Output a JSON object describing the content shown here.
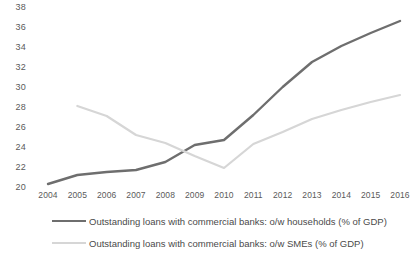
{
  "chart_data": {
    "type": "line",
    "title": "",
    "subtitle": "",
    "xlabel": "",
    "ylabel": "",
    "grid": false,
    "legend_position": "bottom",
    "x": [
      2004,
      2005,
      2006,
      2007,
      2008,
      2009,
      2010,
      2011,
      2012,
      2013,
      2014,
      2015,
      2016
    ],
    "categories": [
      "2004",
      "2005",
      "2006",
      "2007",
      "2008",
      "2009",
      "2010",
      "2011",
      "2012",
      "2013",
      "2014",
      "2015",
      "2016"
    ],
    "xlim": [
      2004,
      2016
    ],
    "ylim": [
      20,
      38
    ],
    "yticks": [
      20,
      22,
      24,
      26,
      28,
      30,
      32,
      34,
      36,
      38
    ],
    "ytick_labels": [
      "20",
      "22",
      "24",
      "26",
      "28",
      "30",
      "32",
      "34",
      "36",
      "38"
    ],
    "series": [
      {
        "name": "Outstanding loans with commercial banks: o/w households (% of GDP)",
        "color": "#6e6e6e",
        "values": [
          20.4,
          21.3,
          21.6,
          21.8,
          22.6,
          24.3,
          24.8,
          27.3,
          30.1,
          32.6,
          34.2,
          35.5,
          36.7
        ]
      },
      {
        "name": "Outstanding loans with commercial banks: o/w SMEs (% of GDP)",
        "color": "#d6d6d6",
        "values": [
          null,
          28.2,
          27.2,
          25.3,
          24.5,
          23.2,
          22.0,
          24.4,
          25.6,
          26.9,
          27.8,
          28.6,
          29.3
        ]
      }
    ]
  },
  "legend": {
    "items": [
      {
        "label": "Outstanding loans with commercial banks: o/w households (% of GDP)"
      },
      {
        "label": "Outstanding loans with commercial banks: o/w SMEs (% of GDP)"
      }
    ]
  }
}
